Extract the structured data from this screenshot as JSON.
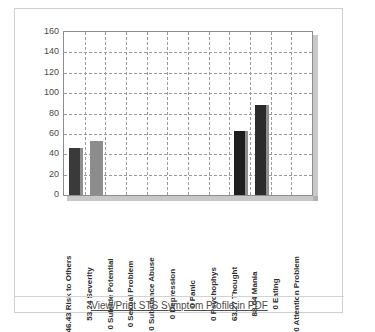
{
  "footer": {
    "pdf_link_label": "View/Print STS Symptom Profile in PDF"
  },
  "chart_data": {
    "type": "bar",
    "title": "",
    "xlabel": "",
    "ylabel": "",
    "ylim": [
      0,
      160
    ],
    "yticks": [
      0,
      20,
      40,
      60,
      80,
      100,
      120,
      140,
      160
    ],
    "grid": true,
    "legend": "none",
    "categories": [
      "46.43 Risk to Others",
      "53.24 Severity",
      "0 Suicide Potential",
      "0 Sexual Problem",
      "0 Substance Abuse",
      "0 Depression",
      "0 Panic",
      "0 Psychophys",
      "63.27 Thought",
      "88.04 Mania",
      "0 Eating",
      "0 Attention Problem"
    ],
    "values": [
      46.43,
      53.24,
      0,
      0,
      0,
      0,
      0,
      0,
      63.27,
      88.04,
      0,
      0
    ],
    "bar_colors": [
      "#3a3a3a",
      "#8c8c8c",
      "#3a3a3a",
      "#8c8c8c",
      "#3a3a3a",
      "#8c8c8c",
      "#3a3a3a",
      "#8c8c8c",
      "#1f1f1f",
      "#2b2b2b",
      "#3a3a3a",
      "#8c8c8c"
    ]
  }
}
